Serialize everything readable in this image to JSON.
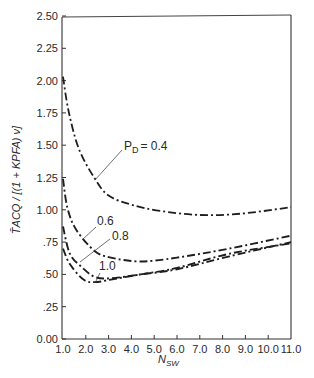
{
  "chart_data": {
    "type": "line",
    "title": "",
    "xlabel": "N_SW",
    "ylabel": "T̄_ACQ / [(1 + K P_FA) ν]",
    "xlim": [
      1.0,
      11.0
    ],
    "ylim": [
      0.0,
      2.5
    ],
    "grid": false,
    "legend": "inline annotations",
    "x_ticks": [
      "1.0",
      "2.0",
      "3.0",
      "4.0",
      "5.0",
      "6.0",
      "7.0",
      "8.0",
      "9.0",
      "10.0",
      "11.0"
    ],
    "y_ticks": [
      "0.00",
      ".25",
      ".50",
      ".75",
      "1.00",
      "1.25",
      "1.50",
      "1.75",
      "2.00",
      "2.25",
      "2.50"
    ],
    "series": [
      {
        "name": "P_D = 0.4",
        "label": "P_D = 0.4",
        "x": [
          1.0,
          1.25,
          1.7,
          2.4,
          3.0,
          4.0,
          5.3,
          7.0,
          8.8,
          11.0
        ],
        "values": [
          2.03,
          1.76,
          1.47,
          1.24,
          1.11,
          1.04,
          0.99,
          0.96,
          0.97,
          1.02
        ]
      },
      {
        "name": "P_D = 0.6",
        "label": "0.6",
        "x": [
          1.0,
          1.2,
          1.6,
          2.4,
          3.1,
          4.4,
          6.0,
          8.3,
          11.0
        ],
        "values": [
          1.24,
          1.01,
          0.84,
          0.68,
          0.63,
          0.6,
          0.63,
          0.7,
          0.8
        ]
      },
      {
        "name": "P_D = 0.8",
        "label": "0.8",
        "x": [
          1.0,
          1.3,
          1.8,
          2.4,
          3.1,
          4.4,
          6.0,
          8.3,
          11.0
        ],
        "values": [
          0.87,
          0.66,
          0.56,
          0.48,
          0.47,
          0.5,
          0.54,
          0.64,
          0.75
        ]
      },
      {
        "name": "P_D = 1.0",
        "label": "1.0",
        "x": [
          1.0,
          1.3,
          1.9,
          2.4,
          3.1,
          4.4,
          6.0,
          8.3,
          11.0
        ],
        "values": [
          0.7,
          0.58,
          0.46,
          0.44,
          0.46,
          0.5,
          0.55,
          0.66,
          0.74
        ]
      }
    ]
  },
  "labels": {
    "pd_prefix": "P",
    "pd_sub": "D",
    "pd_04": "= 0.4",
    "pd_06": "0.6",
    "pd_08": "0.8",
    "pd_10": "1.0",
    "xaxis_main": "N",
    "xaxis_sub": "SW",
    "yaxis_text": "T̄ACQ / [(1 + KPFA) ν]"
  },
  "style": {
    "line_color": "#1e1e1e",
    "axis_color": "#333333"
  }
}
